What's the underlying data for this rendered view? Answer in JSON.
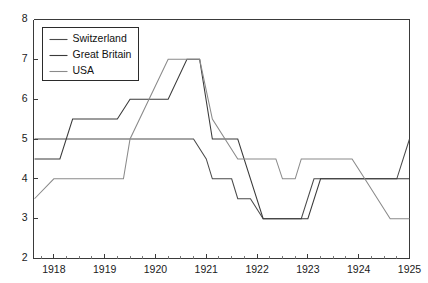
{
  "chart_data": {
    "type": "line",
    "title": "",
    "xlabel": "",
    "ylabel": "",
    "xlim": [
      1917.6,
      1925.0
    ],
    "ylim": [
      2,
      8
    ],
    "xticks": [
      1918,
      1919,
      1920,
      1921,
      1922,
      1923,
      1924,
      1925
    ],
    "xtick_labels": [
      "1918",
      "1919",
      "1920",
      "1921",
      "1922",
      "1923",
      "1924",
      "1925"
    ],
    "yticks": [
      2,
      3,
      4,
      5,
      6,
      7,
      8
    ],
    "ytick_labels": [
      "2",
      "3",
      "4",
      "5",
      "6",
      "7",
      "8"
    ],
    "minor_xticks_per_interval": 3,
    "grid": false,
    "legend_position": "upper left",
    "series": [
      {
        "name": "Switzerland",
        "color": "#4a4a4a",
        "points": [
          [
            1917.62,
            5.0
          ],
          [
            1920.5,
            5.0
          ],
          [
            1920.75,
            5.0
          ],
          [
            1921.0,
            4.5
          ],
          [
            1921.12,
            4.0
          ],
          [
            1921.5,
            4.0
          ],
          [
            1921.62,
            3.5
          ],
          [
            1921.87,
            3.5
          ],
          [
            1922.12,
            3.0
          ],
          [
            1922.87,
            3.0
          ],
          [
            1923.12,
            4.0
          ],
          [
            1924.75,
            4.0
          ],
          [
            1925.0,
            5.0
          ]
        ]
      },
      {
        "name": "Great Britain",
        "color": "#3a3a3a",
        "points": [
          [
            1917.62,
            4.5
          ],
          [
            1918.12,
            4.5
          ],
          [
            1918.37,
            5.5
          ],
          [
            1919.25,
            5.5
          ],
          [
            1919.5,
            6.0
          ],
          [
            1920.25,
            6.0
          ],
          [
            1920.62,
            7.0
          ],
          [
            1920.87,
            7.0
          ],
          [
            1921.12,
            5.0
          ],
          [
            1921.5,
            5.0
          ],
          [
            1921.62,
            5.0
          ],
          [
            1922.12,
            3.0
          ],
          [
            1923.0,
            3.0
          ],
          [
            1923.25,
            4.0
          ],
          [
            1925.0,
            4.0
          ]
        ]
      },
      {
        "name": "USA",
        "color": "#8a8a8a",
        "points": [
          [
            1917.62,
            3.5
          ],
          [
            1918.0,
            4.0
          ],
          [
            1919.37,
            4.0
          ],
          [
            1919.5,
            5.0
          ],
          [
            1920.25,
            7.0
          ],
          [
            1920.87,
            7.0
          ],
          [
            1921.12,
            5.5
          ],
          [
            1921.62,
            4.5
          ],
          [
            1922.37,
            4.5
          ],
          [
            1922.5,
            4.0
          ],
          [
            1922.75,
            4.0
          ],
          [
            1922.87,
            4.5
          ],
          [
            1923.87,
            4.5
          ],
          [
            1924.12,
            4.0
          ],
          [
            1924.62,
            3.0
          ],
          [
            1925.0,
            3.0
          ]
        ]
      }
    ]
  },
  "legend": {
    "entries": [
      {
        "label": "Switzerland"
      },
      {
        "label": "Great Britain"
      },
      {
        "label": "USA"
      }
    ]
  }
}
